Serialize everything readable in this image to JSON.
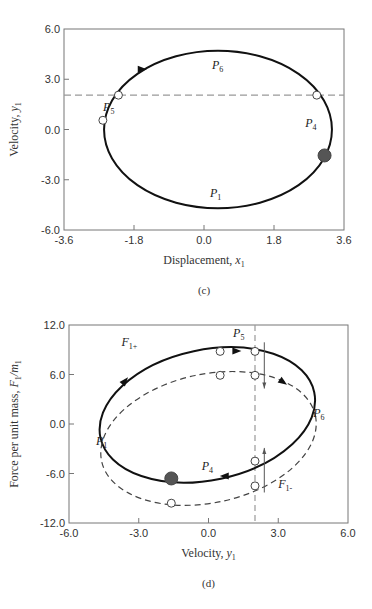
{
  "chart_data": [
    {
      "id": "c",
      "type": "line",
      "caption": "(c)",
      "xlabel": "Displacement, x1",
      "xlabel_main": "Displacement, ",
      "xlabel_var": "x",
      "xlabel_sub": "1",
      "ylabel": "Velocity, y1",
      "ylabel_main": "Velocity, ",
      "ylabel_var": "y",
      "ylabel_sub": "1",
      "xlim": [
        -3.6,
        3.6
      ],
      "ylim": [
        -6.0,
        6.0
      ],
      "xticks": [
        "-3.6",
        "-1.8",
        "0.0",
        "1.8",
        "3.6"
      ],
      "yticks": [
        "6.0",
        "3.0",
        "0.0",
        "-3.0",
        "-6.0"
      ],
      "grid": false,
      "frame_px": {
        "left": 64,
        "top": 29,
        "right": 344,
        "bottom": 230
      },
      "series": [
        {
          "name": "phase trajectory",
          "style": "solid",
          "shape": "ellipse",
          "center": [
            0.36,
            0.0
          ],
          "rx": 2.93,
          "ry": 4.7,
          "rotation_deg": 0
        }
      ],
      "reference_lines": [
        {
          "orientation": "horizontal",
          "value": 2.05,
          "style": "dashed"
        }
      ],
      "points": [
        {
          "x": -2.2,
          "y": 2.05,
          "filled": false
        },
        {
          "x": -2.6,
          "y": 0.55,
          "filled": false
        },
        {
          "x": 2.9,
          "y": 2.05,
          "filled": false
        },
        {
          "x": 3.1,
          "y": -1.55,
          "filled": true
        }
      ],
      "arrows": [
        {
          "x": -1.6,
          "y": 3.6,
          "direction": "right"
        }
      ],
      "labels": [
        {
          "text": "P",
          "sub": "6",
          "x": 0.35,
          "y": 3.6
        },
        {
          "text": "P",
          "sub": "5",
          "x": -2.45,
          "y": 1.1
        },
        {
          "text": "P",
          "sub": "4",
          "x": 2.75,
          "y": 0.15
        },
        {
          "text": "P",
          "sub": "1",
          "x": 0.3,
          "y": -4.0
        }
      ]
    },
    {
      "id": "d",
      "type": "line",
      "caption": "(d)",
      "xlabel": "Velocity, y1",
      "xlabel_main": "Velocity, ",
      "xlabel_var": "y",
      "xlabel_sub": "1",
      "ylabel": "Force per unit mass, F1/m1",
      "ylabel_main": "Force per unit mass, ",
      "ylabel_var": "F",
      "ylabel_sub": "1",
      "ylabel_tail": "/m",
      "ylabel_tail_sub": "1",
      "xlim": [
        -6.0,
        6.0
      ],
      "ylim": [
        -12.0,
        12.0
      ],
      "xticks": [
        "-6.0",
        "-3.0",
        "0.0",
        "3.0",
        "6.0"
      ],
      "yticks": [
        "12.0",
        "6.0",
        "0.0",
        "-6.0",
        "-12.0"
      ],
      "grid": false,
      "frame_px": {
        "left": 69,
        "top": 325,
        "right": 348,
        "bottom": 523
      },
      "series": [
        {
          "name": "F1+ / F1- (solid loop)",
          "style": "solid",
          "shape": "ellipse",
          "center": [
            -0.05,
            1.1
          ],
          "rx": 4.7,
          "ry": 7.9,
          "rotation_deg": -12
        },
        {
          "name": "dashed loop",
          "style": "dashed",
          "shape": "ellipse",
          "center": [
            0.0,
            -1.75
          ],
          "rx": 4.7,
          "ry": 7.8,
          "rotation_deg": -12
        }
      ],
      "reference_lines": [
        {
          "orientation": "vertical",
          "value": 2.0,
          "style": "dashed"
        }
      ],
      "points": [
        {
          "x": 0.5,
          "y": 8.8,
          "filled": false
        },
        {
          "x": 2.0,
          "y": 8.8,
          "filled": false
        },
        {
          "x": 0.5,
          "y": 5.9,
          "filled": false
        },
        {
          "x": 2.0,
          "y": 5.9,
          "filled": false
        },
        {
          "x": 2.0,
          "y": -4.5,
          "filled": false
        },
        {
          "x": 2.0,
          "y": -7.5,
          "filled": false
        },
        {
          "x": -1.6,
          "y": -9.6,
          "filled": false
        },
        {
          "x": -1.6,
          "y": -6.6,
          "filled": true
        }
      ],
      "arrows": [
        {
          "x": -3.6,
          "y": 5.2,
          "direction": "up-right"
        },
        {
          "x": 1.2,
          "y": 8.85,
          "direction": "right"
        },
        {
          "x": 3.2,
          "y": 5.1,
          "direction": "down-right"
        },
        {
          "x": 0.7,
          "y": -6.3,
          "direction": "left"
        }
      ],
      "jump_lines": [
        {
          "x": 2.4,
          "y_from": 9.9,
          "y_to": 4.3,
          "direction": "down"
        },
        {
          "x": 2.4,
          "y_from": -8.3,
          "y_to": -2.9,
          "direction": "up"
        }
      ],
      "labels": [
        {
          "text": "F",
          "sub": "1+",
          "x": -3.4,
          "y": 9.5
        },
        {
          "text": "P",
          "sub": "5",
          "x": 1.3,
          "y": 10.5
        },
        {
          "text": "P",
          "sub": "6",
          "x": 4.75,
          "y": 0.8
        },
        {
          "text": "P",
          "sub": "1",
          "x": -4.6,
          "y": -2.6
        },
        {
          "text": "P",
          "sub": "4",
          "x": -0.05,
          "y": -5.6
        },
        {
          "text": "F",
          "sub": "1-",
          "x": 3.3,
          "y": -7.8
        }
      ]
    }
  ]
}
